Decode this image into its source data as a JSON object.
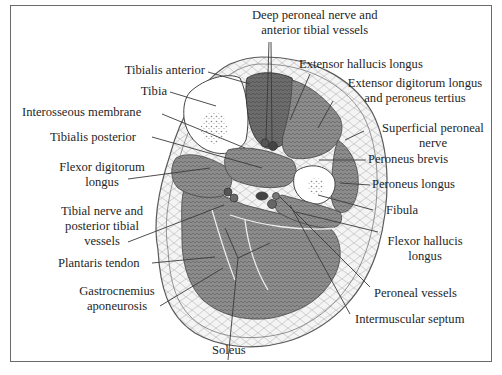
{
  "figure": {
    "labels": {
      "deep_peroneal": [
        "Deep peroneal nerve and",
        "anterior tibial vessels"
      ],
      "tibialis_anterior": "Tibialis anterior",
      "extensor_hallucis_longus": "Extensor hallucis longus",
      "tibia": "Tibia",
      "extensor_digitorum": [
        "Extensor digitorum longus",
        "and peroneus tertius"
      ],
      "interosseous_membrane": "Interosseous membrane",
      "tibialis_posterior": "Tibialis posterior",
      "superficial_peroneal": [
        "Superficial peroneal",
        "nerve"
      ],
      "flexor_digitorum": [
        "Flexor digitorum",
        "longus"
      ],
      "peroneus_brevis": "Peroneus brevis",
      "peroneus_longus": "Peroneus longus",
      "tibial_nerve": [
        "Tibial nerve and",
        "posterior tibial",
        "vessels"
      ],
      "fibula": "Fibula",
      "flexor_hallucis": [
        "Flexor hallucis",
        "longus"
      ],
      "plantaris_tendon": "Plantaris tendon",
      "gastrocnemius": [
        "Gastrocnemius",
        "aponeurosis"
      ],
      "peroneal_vessels": "Peroneal vessels",
      "intermuscular_septum": "Intermuscular septum",
      "soleus": "Soleus"
    },
    "colors": {
      "muscle": "#8a8a8a",
      "muscle_dark": "#6e6e6e",
      "bone": "#ffffff",
      "fat": "#f2f2f2",
      "line": "#3a3a3a",
      "frame": "#6a6a6a",
      "text": "#1f1f1f"
    }
  }
}
